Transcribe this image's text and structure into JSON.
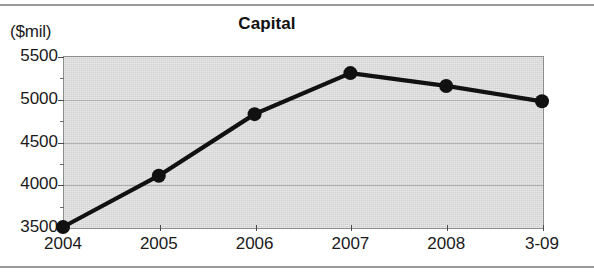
{
  "chart_data": {
    "type": "line",
    "title": "Capital",
    "ylabel": "($mil)",
    "xlabel": "",
    "categories": [
      "2004",
      "2005",
      "2006",
      "2007",
      "2008",
      "3-09"
    ],
    "values": [
      3500,
      4100,
      4820,
      5300,
      5150,
      4970
    ],
    "series": [
      {
        "name": "Capital",
        "values": [
          3500,
          4100,
          4820,
          5300,
          5150,
          4970
        ]
      }
    ],
    "ylim": [
      3500,
      5500
    ],
    "ytick_labels": [
      "3500",
      "4000",
      "4500",
      "5000",
      "5500"
    ],
    "ytick_values": [
      3500,
      4000,
      4500,
      5000,
      5500
    ],
    "yminor_values": [
      3750,
      4250,
      4750,
      5250
    ],
    "grid": true,
    "legend": "none",
    "plot_background": "#d2d2d2",
    "line_color": "#111111",
    "marker_color": "#111111"
  }
}
